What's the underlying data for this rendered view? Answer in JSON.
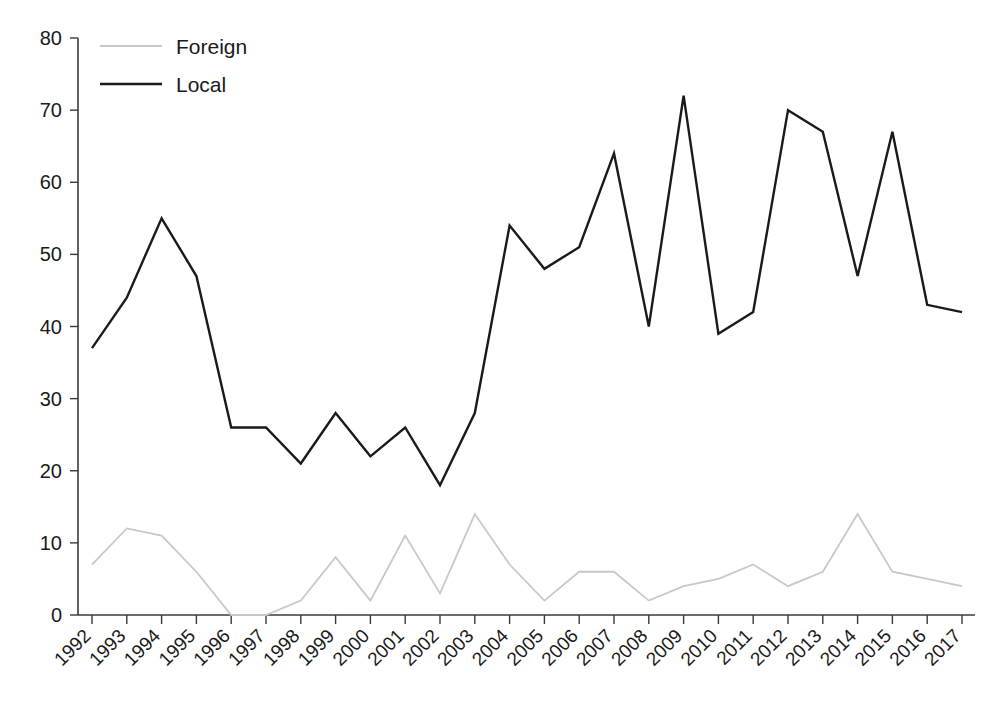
{
  "chart_data": {
    "type": "line",
    "title": "",
    "subtitle": "",
    "xlabel": "",
    "ylabel": "",
    "xlim": [
      1992,
      2017
    ],
    "ylim": [
      0,
      80
    ],
    "yticks": [
      0,
      10,
      20,
      30,
      40,
      50,
      60,
      70,
      80
    ],
    "ytick_labels": [
      "0",
      "10",
      "20",
      "30",
      "40",
      "50",
      "60",
      "70",
      "80"
    ],
    "grid": false,
    "legend_position": "top-left",
    "categories": [
      1992,
      1993,
      1994,
      1995,
      1996,
      1997,
      1998,
      1999,
      2000,
      2001,
      2002,
      2003,
      2004,
      2005,
      2006,
      2007,
      2008,
      2009,
      2010,
      2011,
      2012,
      2013,
      2014,
      2015,
      2016,
      2017
    ],
    "xtick_labels": [
      "1992",
      "1993",
      "1994",
      "1995",
      "1996",
      "1997",
      "1998",
      "1999",
      "2000",
      "2001",
      "2002",
      "2003",
      "2004",
      "2005",
      "2006",
      "2007",
      "2008",
      "2009",
      "2010",
      "2011",
      "2012",
      "2013",
      "2014",
      "2015",
      "2016",
      "2017"
    ],
    "series": [
      {
        "name": "Foreign",
        "color": "#c8c8c8",
        "width": 1.8,
        "values": [
          7,
          12,
          11,
          6,
          0,
          0,
          2,
          8,
          2,
          11,
          3,
          14,
          7,
          2,
          6,
          6,
          2,
          4,
          5,
          7,
          4,
          6,
          14,
          6,
          5,
          4
        ]
      },
      {
        "name": "Local",
        "color": "#1a1a1a",
        "width": 2.4,
        "values": [
          37,
          44,
          55,
          47,
          26,
          26,
          21,
          28,
          22,
          26,
          18,
          28,
          54,
          48,
          51,
          64,
          40,
          72,
          39,
          42,
          70,
          67,
          47,
          67,
          43,
          42
        ]
      }
    ]
  },
  "legend": {
    "items": [
      {
        "label": "Foreign",
        "color": "#c8c8c8"
      },
      {
        "label": "Local",
        "color": "#1a1a1a"
      }
    ]
  }
}
